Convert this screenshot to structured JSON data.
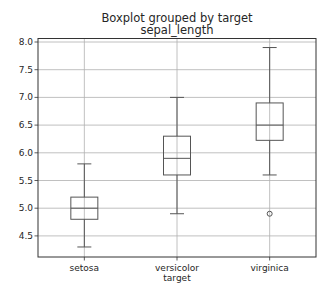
{
  "chart_data": {
    "type": "boxplot",
    "title": "Boxplot grouped by target",
    "subtitle": "sepal_length",
    "xlabel": "target",
    "ylabel": "",
    "ylim": [
      4.1,
      8.07
    ],
    "yticks": [
      "4.5",
      "5.0",
      "5.5",
      "6.0",
      "6.5",
      "7.0",
      "7.5",
      "8.0"
    ],
    "ytick_values": [
      4.5,
      5.0,
      5.5,
      6.0,
      6.5,
      7.0,
      7.5,
      8.0
    ],
    "grid": true,
    "categories": [
      "setosa",
      "versicolor",
      "virginica"
    ],
    "boxes": [
      {
        "name": "setosa",
        "whisker_low": 4.3,
        "q1": 4.8,
        "median": 5.0,
        "q3": 5.2,
        "whisker_high": 5.8,
        "outliers": []
      },
      {
        "name": "versicolor",
        "whisker_low": 4.9,
        "q1": 5.6,
        "median": 5.9,
        "q3": 6.3,
        "whisker_high": 7.0,
        "outliers": []
      },
      {
        "name": "virginica",
        "whisker_low": 5.6,
        "q1": 6.225,
        "median": 6.5,
        "q3": 6.9,
        "whisker_high": 7.9,
        "outliers": [
          4.9
        ]
      }
    ],
    "colors": {
      "box": "#555555",
      "grid": "#b0b0b0",
      "axis": "#333333"
    }
  }
}
